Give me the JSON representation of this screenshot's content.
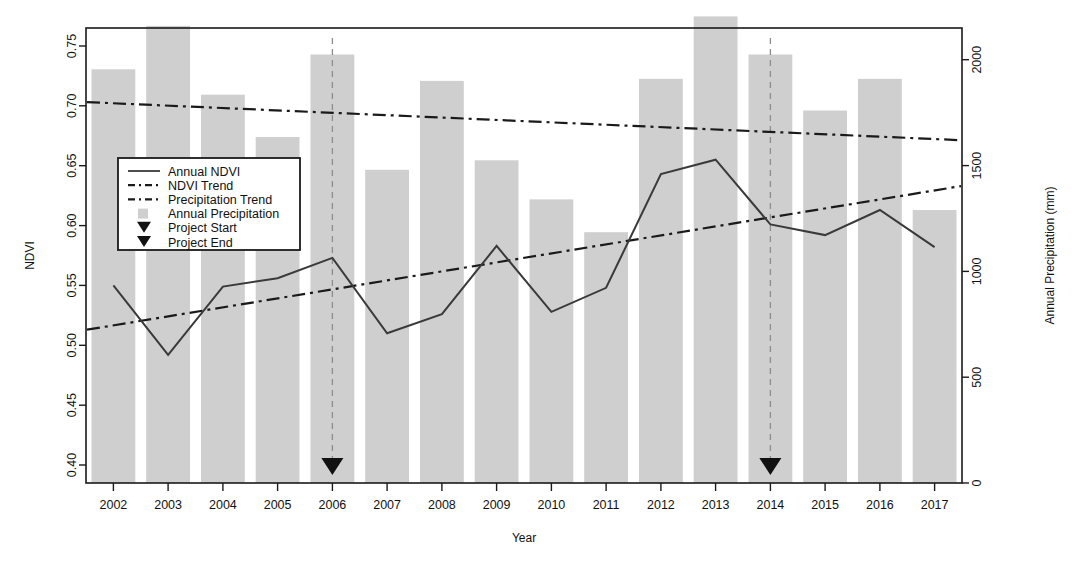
{
  "chart_data": {
    "type": "bar",
    "title": "",
    "xlabel": "Year",
    "ylabel": "NDVI",
    "y2label": "Annual Precipitation (mm)",
    "grid": false,
    "legend_position": "upper-left-inside",
    "categories": [
      "2002",
      "2003",
      "2004",
      "2005",
      "2006",
      "2007",
      "2008",
      "2009",
      "2010",
      "2011",
      "2012",
      "2013",
      "2014",
      "2015",
      "2016",
      "2017"
    ],
    "x": [
      2002,
      2003,
      2004,
      2005,
      2006,
      2007,
      2008,
      2009,
      2010,
      2011,
      2012,
      2013,
      2014,
      2015,
      2016,
      2017
    ],
    "ylim": [
      0.385,
      0.765
    ],
    "yticks": [
      0.4,
      0.45,
      0.5,
      0.55,
      0.6,
      0.65,
      0.7,
      0.75
    ],
    "ytick_labels": [
      "0.40",
      "0.45",
      "0.50",
      "0.55",
      "0.60",
      "0.65",
      "0.70",
      "0.75"
    ],
    "y2lim": [
      0,
      2150
    ],
    "y2ticks": [
      0,
      500,
      1000,
      1500,
      2000
    ],
    "y2tick_labels": [
      "0",
      "500",
      "1000",
      "1500",
      "2000"
    ],
    "series": [
      {
        "name": "Annual Precipitation",
        "kind": "bar",
        "axis": "right",
        "color": "#cfcfcf",
        "values": [
          1955,
          2160,
          1835,
          1635,
          2025,
          1480,
          1900,
          1525,
          1340,
          1185,
          1910,
          2205,
          2025,
          1760,
          1910,
          1290
        ]
      },
      {
        "name": "Annual NDVI",
        "kind": "line",
        "axis": "left",
        "color": "#3a3a3a",
        "values": [
          0.55,
          0.492,
          0.549,
          0.556,
          0.573,
          0.51,
          0.526,
          0.583,
          0.528,
          0.548,
          0.643,
          0.655,
          0.601,
          0.592,
          0.613,
          0.582
        ]
      },
      {
        "name": "NDVI Trend",
        "kind": "trend",
        "axis": "left",
        "color": "#1a1a1a",
        "endpoints": [
          0.513,
          0.633
        ]
      },
      {
        "name": "Precipitation Trend",
        "kind": "trend",
        "axis": "right",
        "color": "#1a1a1a",
        "endpoints": [
          1800,
          1620
        ]
      }
    ],
    "annotations": [
      {
        "name": "Project Start",
        "year": 2006,
        "marker": "triangle-down"
      },
      {
        "name": "Project End",
        "year": 2014,
        "marker": "triangle-down"
      }
    ]
  },
  "legend": {
    "items": [
      {
        "label": "Annual NDVI",
        "glyph": "solid-line"
      },
      {
        "label": "NDVI Trend",
        "glyph": "dash-dot-line"
      },
      {
        "label": "Precipitation Trend",
        "glyph": "dash-dot-line"
      },
      {
        "label": "Annual Precipitation",
        "glyph": "gray-square"
      },
      {
        "label": "Project Start",
        "glyph": "triangle-down"
      },
      {
        "label": "Project End",
        "glyph": "triangle-down"
      }
    ]
  },
  "colors": {
    "bar": "#cfcfcf",
    "line": "#3a3a3a",
    "trend": "#1a1a1a",
    "event": "#8d8d8d",
    "axis": "#1a1a1a",
    "background": "#ffffff"
  }
}
